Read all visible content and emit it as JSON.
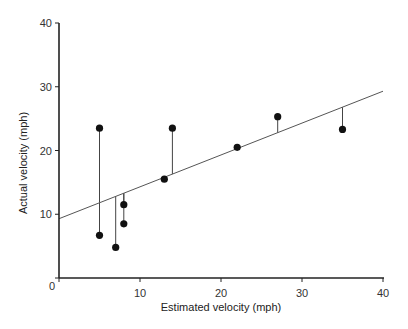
{
  "chart_data": {
    "type": "scatter",
    "title": "",
    "xlabel": "Estimated velocity (mph)",
    "ylabel": "Actual velocity (mph)",
    "xlim": [
      0,
      40
    ],
    "ylim": [
      0,
      40
    ],
    "x_ticks": [
      0,
      10,
      20,
      30,
      40
    ],
    "y_ticks": [
      0,
      10,
      20,
      30,
      40
    ],
    "grid": false,
    "legend": null,
    "series": [
      {
        "name": "observations",
        "points": [
          {
            "x": 5,
            "y": 23.5
          },
          {
            "x": 5,
            "y": 6.7
          },
          {
            "x": 7,
            "y": 4.8
          },
          {
            "x": 8,
            "y": 11.5
          },
          {
            "x": 8,
            "y": 8.5
          },
          {
            "x": 13,
            "y": 15.5
          },
          {
            "x": 14,
            "y": 23.5
          },
          {
            "x": 22,
            "y": 20.5
          },
          {
            "x": 27,
            "y": 25.3
          },
          {
            "x": 35,
            "y": 23.3
          }
        ]
      }
    ],
    "regression_line": {
      "x0": 0,
      "y0": 9.3,
      "x1": 40,
      "y1": 29.3
    },
    "annotations": [
      "Vertical residual lines connect each point to the fitted regression line"
    ],
    "colors": {
      "points": "#111111",
      "line": "#555555",
      "axis": "#222222"
    }
  },
  "axes": {
    "x_tick_labels": [
      "0",
      "10",
      "20",
      "30",
      "40"
    ],
    "y_tick_labels": [
      "10",
      "20",
      "30",
      "40"
    ],
    "origin_label": "0",
    "xlabel": "Estimated velocity (mph)",
    "ylabel": "Actual velocity (mph)"
  }
}
